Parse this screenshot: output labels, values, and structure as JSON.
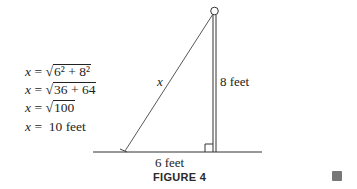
{
  "equations": [
    {
      "lhs": "x",
      "rhs_prefix": "",
      "radicand": "6² + 8²",
      "suffix": ""
    },
    {
      "lhs": "x",
      "rhs_prefix": "",
      "radicand": "36 + 64",
      "suffix": ""
    },
    {
      "lhs": "x",
      "rhs_prefix": "",
      "radicand": "100",
      "suffix": ""
    },
    {
      "lhs": "x",
      "rhs_prefix": "10 feet",
      "radicand": "",
      "suffix": ""
    }
  ],
  "diagram": {
    "hypotenuse_label": "x",
    "height_label": "8 feet",
    "base_label": "6 feet",
    "caption": "FIGURE 4"
  },
  "icons": {
    "corner": "page-thumbnail-icon"
  }
}
